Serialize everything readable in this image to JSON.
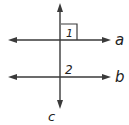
{
  "diagram": {
    "type": "parallel-lines-with-transversal",
    "colors": {
      "line": "#3a3a3a",
      "text": "#222222",
      "background": "#ffffff"
    },
    "lines": [
      {
        "id": "a",
        "label": "a",
        "orientation": "horizontal"
      },
      {
        "id": "b",
        "label": "b",
        "orientation": "horizontal"
      },
      {
        "id": "c",
        "label": "c",
        "orientation": "vertical",
        "role": "transversal"
      }
    ],
    "angles": [
      {
        "id": "1",
        "label": "1",
        "marker": "right-angle",
        "position": "above line a, right of line c"
      },
      {
        "id": "2",
        "label": "2",
        "marker": "none",
        "position": "above line b, right of line c"
      }
    ]
  }
}
